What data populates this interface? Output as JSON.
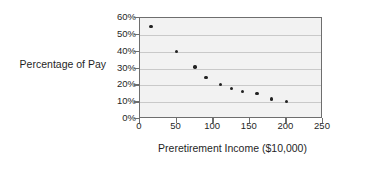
{
  "chart_data": {
    "type": "scatter",
    "title": "",
    "xlabel": "Preretirement Income ($10,000)",
    "ylabel": "Percentage of Pay",
    "xlim": [
      0,
      250
    ],
    "ylim": [
      0,
      60
    ],
    "grid": true,
    "legend": false,
    "xticks": [
      0,
      50,
      100,
      150,
      200,
      250
    ],
    "xtick_labels": [
      "0",
      "50",
      "100",
      "150",
      "200",
      "250"
    ],
    "yticks": [
      0,
      10,
      20,
      30,
      40,
      50,
      60
    ],
    "ytick_labels": [
      "0%",
      "10%",
      "20%",
      "30%",
      "40%",
      "50%",
      "60%"
    ],
    "x": [
      15,
      50,
      75,
      90,
      110,
      125,
      140,
      160,
      180,
      200
    ],
    "y": [
      55,
      40,
      31,
      24.5,
      20.5,
      18,
      16.5,
      15,
      12,
      10.5
    ],
    "points": [
      {
        "x": 15,
        "y": 55
      },
      {
        "x": 50,
        "y": 40
      },
      {
        "x": 75,
        "y": 31
      },
      {
        "x": 90,
        "y": 24.5
      },
      {
        "x": 110,
        "y": 20.5
      },
      {
        "x": 125,
        "y": 18
      },
      {
        "x": 140,
        "y": 16.5
      },
      {
        "x": 160,
        "y": 15
      },
      {
        "x": 180,
        "y": 12
      },
      {
        "x": 200,
        "y": 10.5
      }
    ],
    "marker_color": "#222222",
    "plot_background": "#f2f2f2",
    "grid_color": "#c9c9c9",
    "axis_color": "#6e6e6e"
  }
}
